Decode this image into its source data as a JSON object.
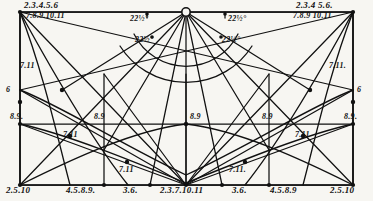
{
  "figure": {
    "type": "geometric-construction-diagram",
    "title_visible": false,
    "ink_color": "#111111",
    "paper_color": "#f7f6f2",
    "width": 373,
    "height": 201
  },
  "labels": {
    "top_left_upper": "2.3.4.5.6",
    "top_left_lower": "7.8.9.10.11",
    "top_right_upper": "2.3.4 5.6.",
    "top_right_lower": "7.8.9 10.11",
    "angle_left_outer": "22½°",
    "angle_left_inner": "22½°",
    "angle_right_outer": "22½°",
    "angle_right_inner": "22½°",
    "left_seven_eleven": "7.11",
    "right_seven_eleven": "7.11.",
    "left_six": "6",
    "right_six": "6",
    "mid_left_eight_nine": "8.9.",
    "mid_center_eight_nine": "8.9",
    "mid_right_inner_eight_nine": "8.9",
    "mid_right_eight_nine": "8.9.",
    "lower_left_seven_eleven": "7.11",
    "lower_left_in_seven_eleven": "7.11",
    "lower_right_in_seven_eleven": "7.11.",
    "lower_right_seven_eleven": "7.11",
    "bottom_left": "2.5.10",
    "bottom_left_mid": "4.5.8.9.",
    "bottom_center_left": "3.6.",
    "bottom_center": "2.3.7.10.11",
    "bottom_center_right": "3.6.",
    "bottom_right_mid": "4.5.8.9",
    "bottom_right": "2.5.10"
  }
}
